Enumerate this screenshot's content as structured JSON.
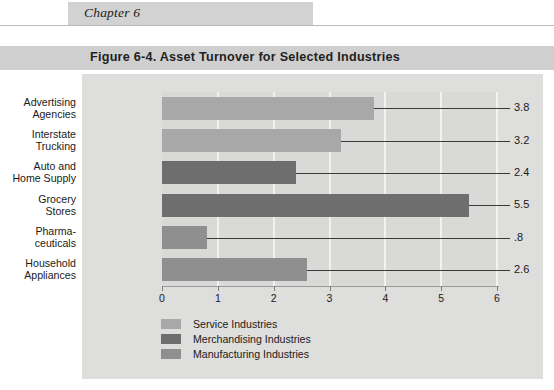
{
  "page": {
    "running_head": "Chapter 6"
  },
  "figure": {
    "title": "Figure 6-4. Asset Turnover for Selected Industries"
  },
  "chart_data": {
    "type": "bar",
    "orientation": "horizontal",
    "title": "Figure 6-4. Asset Turnover for Selected Industries",
    "xlabel": "",
    "ylabel": "",
    "xlim": [
      0,
      6
    ],
    "xticks": [
      "0",
      "1",
      "2",
      "3",
      "4",
      "5",
      "6"
    ],
    "grid": true,
    "legend_position": "bottom-left",
    "categories": [
      "Advertising Agencies",
      "Interstate Trucking",
      "Auto and Home Supply",
      "Grocery Stores",
      "Pharmaceuticals",
      "Household Appliances"
    ],
    "values": [
      3.8,
      3.2,
      2.4,
      5.5,
      0.8,
      2.6
    ],
    "value_labels": [
      "3.8",
      "3.2",
      "2.4",
      "5.5",
      ".8",
      "2.6"
    ],
    "groups": [
      "Service Industries",
      "Service Industries",
      "Merchandising Industries",
      "Merchandising Industries",
      "Manufacturing Industries",
      "Manufacturing Industries"
    ],
    "bars": [
      {
        "label_line1": "Advertising",
        "label_line2": "Agencies",
        "value": 3.8,
        "value_label": "3.8",
        "group": "service"
      },
      {
        "label_line1": "Interstate",
        "label_line2": "Trucking",
        "value": 3.2,
        "value_label": "3.2",
        "group": "service"
      },
      {
        "label_line1": "Auto and",
        "label_line2": "Home Supply",
        "value": 2.4,
        "value_label": "2.4",
        "group": "merchandising"
      },
      {
        "label_line1": "Grocery",
        "label_line2": "Stores",
        "value": 5.5,
        "value_label": "5.5",
        "group": "merchandising"
      },
      {
        "label_line1": "Pharma-",
        "label_line2": "ceuticals",
        "value": 0.8,
        "value_label": ".8",
        "group": "manufacturing"
      },
      {
        "label_line1": "Household",
        "label_line2": "Appliances",
        "value": 2.6,
        "value_label": "2.6",
        "group": "manufacturing"
      }
    ],
    "legend": [
      {
        "label": "Service Industries",
        "color": "#a8a8a8",
        "key": "service"
      },
      {
        "label": "Merchandising Industries",
        "color": "#6e6e6e",
        "key": "merchandising"
      },
      {
        "label": "Manufacturing Industries",
        "color": "#8f8f8f",
        "key": "manufacturing"
      }
    ],
    "colors": {
      "service": "#a8a8a8",
      "merchandising": "#6e6e6e",
      "manufacturing": "#8f8f8f",
      "panel": "#dededd",
      "plot": "#d9d9d8",
      "gridline": "#f2f2f1",
      "title_band": "#cfcfcf",
      "runhead_band": "#d2d2d2"
    }
  }
}
